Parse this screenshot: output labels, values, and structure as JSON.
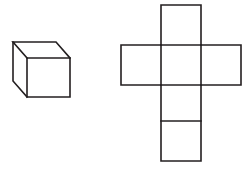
{
  "figure": {
    "background_color": "#ffffff",
    "stroke_color": "#231f20",
    "stroke_width": 1.6,
    "canvas": {
      "width": 249,
      "height": 170
    },
    "objects": [
      {
        "name": "cube-solid",
        "label": "3D cube",
        "type": "isometric-cube",
        "front_face": {
          "x": 27,
          "y": 58,
          "width": 43,
          "height": 39
        },
        "depth_offset": {
          "dx": -14,
          "dy": -16
        },
        "visible_faces": [
          "front",
          "top",
          "left"
        ],
        "edges": [
          {
            "name": "front-face",
            "points": "27,58 70,58 70,97 27,97 27,58"
          },
          {
            "name": "top-face",
            "points": "27,58 13,42 56,42 70,58"
          },
          {
            "name": "left-face",
            "points": "27,97 13,81 13,42"
          }
        ]
      },
      {
        "name": "cube-net",
        "label": "Unfolded cube net (cross shape)",
        "type": "polyomino-net",
        "cell_size": 40,
        "origin": {
          "x": 121,
          "y": 5
        },
        "columns": 3,
        "rows": 4,
        "faces": [
          {
            "name": "net-face-top",
            "col": 1,
            "row": 0,
            "x": 161,
            "y": 5,
            "width": 40,
            "height": 40
          },
          {
            "name": "net-face-left",
            "col": 0,
            "row": 1,
            "x": 121,
            "y": 45,
            "width": 40,
            "height": 40
          },
          {
            "name": "net-face-front",
            "col": 1,
            "row": 1,
            "x": 161,
            "y": 45,
            "width": 40,
            "height": 40
          },
          {
            "name": "net-face-right",
            "col": 2,
            "row": 1,
            "x": 201,
            "y": 45,
            "width": 40,
            "height": 40
          },
          {
            "name": "net-face-bottom",
            "col": 1,
            "row": 2,
            "x": 161,
            "y": 85,
            "width": 40,
            "height": 36
          },
          {
            "name": "net-face-back",
            "col": 1,
            "row": 3,
            "x": 161,
            "y": 121,
            "width": 40,
            "height": 40
          }
        ],
        "outline": "161,5 201,5 201,45 241,45 241,85 201,85 201,161 161,161 161,85 121,85 121,45 161,45 161,5",
        "internal_lines": [
          {
            "name": "net-divider-top-row",
            "x1": 161,
            "y1": 45,
            "x2": 201,
            "y2": 45
          },
          {
            "name": "net-divider-left-seam",
            "x1": 161,
            "y1": 45,
            "x2": 161,
            "y2": 85
          },
          {
            "name": "net-divider-right-seam",
            "x1": 201,
            "y1": 45,
            "x2": 201,
            "y2": 85
          },
          {
            "name": "net-divider-mid-row",
            "x1": 161,
            "y1": 85,
            "x2": 201,
            "y2": 85
          },
          {
            "name": "net-divider-low-row",
            "x1": 161,
            "y1": 121,
            "x2": 201,
            "y2": 121
          }
        ]
      }
    ]
  }
}
